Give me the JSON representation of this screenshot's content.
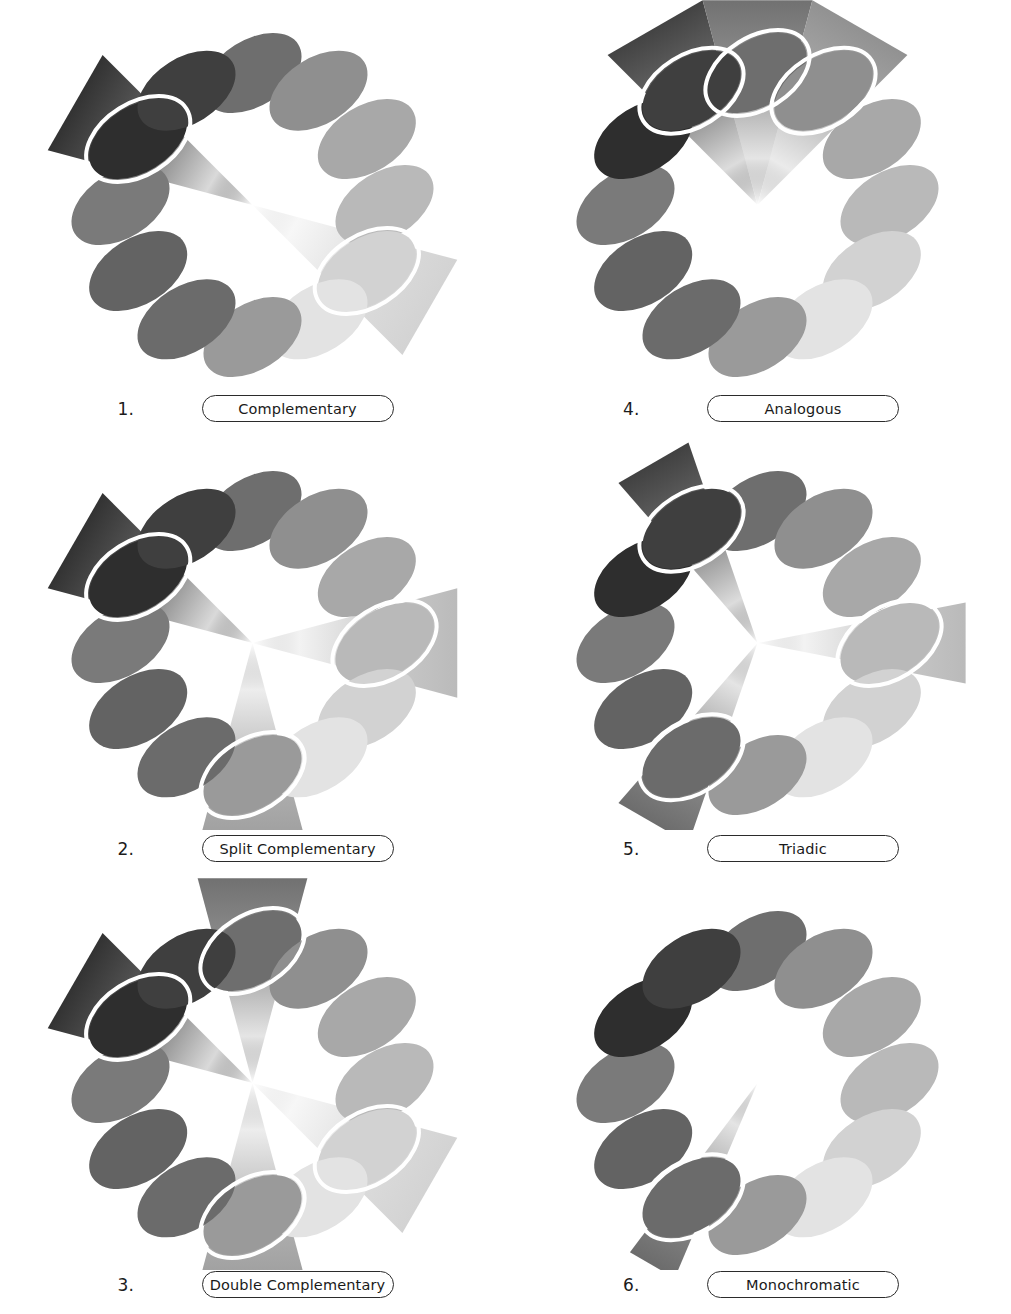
{
  "document": {
    "title": "Color Harmony Schemes",
    "background_color": "#ffffff",
    "panel_count": 6,
    "wheel_swatch_count": 12
  },
  "wheel": {
    "center_x": 252,
    "center_y": 205,
    "ring_radius": 132,
    "swatch_rx": 54,
    "swatch_ry": 33,
    "swatch_tilt_deg": -32,
    "wedge_outer_radius": 212,
    "swatch_colors": [
      "#6e6e6e",
      "#8f8f8f",
      "#a8a8a8",
      "#b9b9b9",
      "#d2d2d2",
      "#e3e3e3",
      "#9a9a9a",
      "#6b6b6b",
      "#636363",
      "#7a7a7a",
      "#2e2e2e",
      "#3f3f3f"
    ],
    "swatch_dark_color": "#1a1a1a",
    "swatch_light_color": "#e3e3e3",
    "wedge_outline_color": "#ffffff",
    "wedge_outline_width": 4
  },
  "panels": [
    {
      "number": "1.",
      "label": "Complementary",
      "scheme": "complementary",
      "highlighted_positions": [
        10,
        4
      ],
      "wedge_count": 2,
      "wedge_span_deg": 30
    },
    {
      "number": "2.",
      "label": "Split Complementary",
      "scheme": "split-complementary",
      "highlighted_positions": [
        10,
        3,
        6
      ],
      "wedge_count": 3,
      "wedge_span_deg": 30
    },
    {
      "number": "3.",
      "label": "Double Complementary",
      "scheme": "double-complementary",
      "highlighted_positions": [
        10,
        0,
        4,
        6
      ],
      "wedge_count": 4,
      "wedge_span_deg": 30
    },
    {
      "number": "4.",
      "label": "Analogous",
      "scheme": "analogous",
      "highlighted_positions": [
        11,
        0,
        1
      ],
      "wedge_count": 3,
      "wedge_span_deg": 30
    },
    {
      "number": "5.",
      "label": "Triadic",
      "scheme": "triadic",
      "highlighted_positions": [
        11,
        3,
        7
      ],
      "wedge_count": 3,
      "wedge_span_deg": 22
    },
    {
      "number": "6.",
      "label": "Monochromatic",
      "scheme": "monochromatic",
      "highlighted_positions": [
        7
      ],
      "wedge_count": 1,
      "wedge_span_deg": 14
    }
  ],
  "chart_data": {
    "type": "pie",
    "categories": [
      "Complementary",
      "Split Complementary",
      "Double Complementary",
      "Analogous",
      "Triadic",
      "Monochromatic"
    ],
    "values": [
      2,
      3,
      4,
      3,
      3,
      1
    ],
    "xlabel": "Scheme",
    "ylabel": "Number of highlighted hues",
    "legend": "none",
    "grid": false
  }
}
